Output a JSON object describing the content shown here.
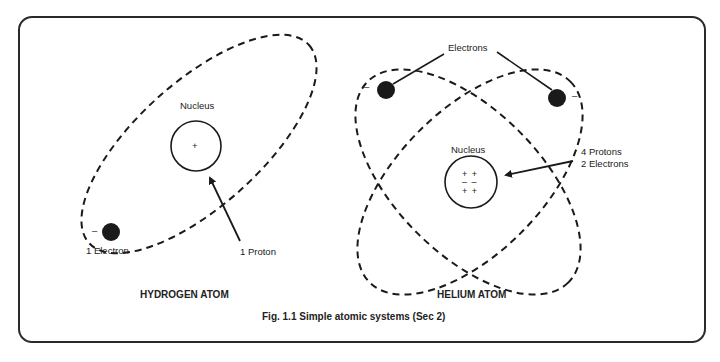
{
  "hydrogen": {
    "title": "HYDROGEN ATOM",
    "nucleus_label": "Nucleus",
    "nucleus_charges": "+",
    "electron_label": "1 Electron",
    "electron_charge": "–",
    "proton_label": "1 Proton"
  },
  "helium": {
    "title": "HELIUM ATOM",
    "nucleus_label": "Nucleus",
    "electrons_label": "Electrons",
    "electron_charge_left": "–",
    "electron_charge_right": "–",
    "nucleus_contents_line1": "4 Protons",
    "nucleus_contents_line2": "2 Electrons",
    "nucleus_charges": {
      "top": "+ +",
      "middle": "– –",
      "bottom": "+ +"
    }
  },
  "caption": "Fig. 1.1 Simple atomic systems (Sec 2)",
  "colors": {
    "ink": "#1a1a1a",
    "background": "#ffffff"
  }
}
